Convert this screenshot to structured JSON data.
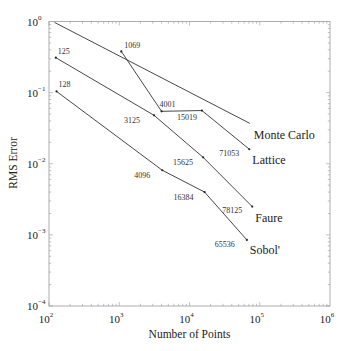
{
  "chart_data": {
    "type": "line",
    "title": "",
    "xlabel": "Number of Points",
    "ylabel": "RMS Error",
    "xscale": "log",
    "yscale": "log",
    "xlim": [
      100,
      1000000
    ],
    "ylim": [
      0.0001,
      1
    ],
    "grid": false,
    "legend": "inline labels at series ends",
    "x_ticks": [
      {
        "value": 100,
        "base": "10",
        "exp": "2"
      },
      {
        "value": 1000,
        "base": "10",
        "exp": "3"
      },
      {
        "value": 10000,
        "base": "10",
        "exp": "4"
      },
      {
        "value": 100000,
        "base": "10",
        "exp": "5"
      },
      {
        "value": 1000000,
        "base": "10",
        "exp": "6"
      }
    ],
    "y_ticks": [
      {
        "value": 1,
        "base": "10",
        "exp": "0"
      },
      {
        "value": 0.1,
        "base": "10",
        "exp": "−1"
      },
      {
        "value": 0.01,
        "base": "10",
        "exp": "−2"
      },
      {
        "value": 0.001,
        "base": "10",
        "exp": "−3"
      },
      {
        "value": 0.0001,
        "base": "10",
        "exp": "−4"
      }
    ],
    "series": [
      {
        "name": "Monte Carlo",
        "points": [
          {
            "x": 120,
            "y": 0.97,
            "label": ""
          },
          {
            "x": 72000,
            "y": 0.037,
            "label": ""
          }
        ]
      },
      {
        "name": "Lattice",
        "points": [
          {
            "x": 1069,
            "y": 0.38,
            "label": "1069"
          },
          {
            "x": 4001,
            "y": 0.0546,
            "label": "4001"
          },
          {
            "x": 15019,
            "y": 0.056,
            "label": "15019"
          },
          {
            "x": 71053,
            "y": 0.016,
            "label": "71053"
          }
        ]
      },
      {
        "name": "Faure",
        "points": [
          {
            "x": 125,
            "y": 0.31,
            "label": "125"
          },
          {
            "x": 3125,
            "y": 0.048,
            "label": "3125"
          },
          {
            "x": 15625,
            "y": 0.0123,
            "label": "15625"
          },
          {
            "x": 78125,
            "y": 0.0025,
            "label": "78125"
          }
        ]
      },
      {
        "name": "Sobol'",
        "points": [
          {
            "x": 128,
            "y": 0.104,
            "label": "128"
          },
          {
            "x": 4096,
            "y": 0.0081,
            "label": "4096"
          },
          {
            "x": 16384,
            "y": 0.004,
            "label": "16384"
          },
          {
            "x": 65536,
            "y": 0.00085,
            "label": "65536"
          }
        ]
      }
    ]
  },
  "layout": {
    "plot": {
      "left": 49,
      "top": 21.5,
      "right": 330,
      "bottom": 306
    },
    "series_label_offsets": {
      "Monte Carlo": {
        "dx": 4,
        "dy": 16
      },
      "Lattice": {
        "dx": 3,
        "dy": 15
      },
      "Faure": {
        "dx": 3,
        "dy": 15
      },
      "Sobol'": {
        "dx": 3,
        "dy": 14
      }
    },
    "point_label_offsets": [
      [],
      [
        {
          "dx": 3,
          "dy": -3
        },
        {
          "dx": -2,
          "dy": -4
        },
        {
          "dx": -25,
          "dy": 9
        },
        {
          "dx": -30,
          "dy": 7
        }
      ],
      [
        {
          "dx": 2,
          "dy": -4
        },
        {
          "dx": -30,
          "dy": 8
        },
        {
          "dx": -30,
          "dy": 8
        },
        {
          "dx": -30,
          "dy": 6
        }
      ],
      [
        {
          "dx": 2,
          "dy": -4
        },
        {
          "dx": -28,
          "dy": 8
        },
        {
          "dx": -31,
          "dy": 8
        },
        {
          "dx": -32,
          "dy": 7
        }
      ]
    ]
  }
}
